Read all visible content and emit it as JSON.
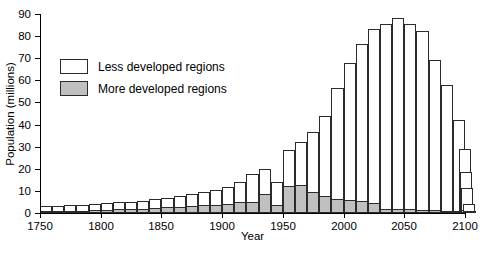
{
  "chart_data": {
    "type": "bar",
    "title": "",
    "xlabel": "Year",
    "ylabel": "Population (millions)",
    "xlim": [
      1750,
      2100
    ],
    "ylim": [
      0,
      90
    ],
    "ytick_values": [
      0,
      10,
      20,
      30,
      40,
      50,
      60,
      70,
      80,
      90
    ],
    "ytick_labels": [
      "0",
      "10",
      "20",
      "30",
      "40",
      "50",
      "60",
      "70",
      "80",
      "90"
    ],
    "xtick_values": [
      1750,
      1800,
      1850,
      1900,
      1950,
      2000,
      2050,
      2100
    ],
    "xtick_labels": [
      "1750",
      "1800",
      "1850",
      "1900",
      "1950",
      "2000",
      "2050",
      "2100"
    ],
    "grid": false,
    "stacked": true,
    "bar_interval_years": 10,
    "legend_position": "upper-left-inset",
    "series": [
      {
        "name": "Less developed regions",
        "color": "#ffffff",
        "values": [
          2.2,
          2.3,
          2.4,
          2.6,
          2.8,
          3.0,
          3.2,
          3.4,
          3.6,
          4.0,
          4.4,
          4.8,
          5.4,
          6.0,
          6.5,
          7.5,
          9.2,
          12.5,
          11.5,
          10.5,
          16.5,
          19.5,
          27.0,
          36.5,
          50.0,
          62.0,
          71.0,
          78.5,
          83.5,
          86.5,
          84.0,
          81.0,
          68.0,
          57.0,
          41.0,
          28.0,
          18.0,
          10.0,
          3.5,
          0.6
        ]
      },
      {
        "name": "More developed regions",
        "color": "#c0c0c0",
        "values": [
          0.8,
          0.9,
          1.0,
          1.1,
          1.2,
          1.4,
          1.6,
          1.8,
          2.0,
          2.2,
          2.5,
          2.8,
          3.1,
          3.4,
          3.8,
          4.3,
          4.8,
          5.2,
          8.5,
          3.5,
          12.0,
          12.5,
          9.5,
          7.5,
          6.5,
          6.0,
          5.5,
          4.5,
          2.0,
          1.8,
          1.6,
          1.4,
          1.2,
          1.0,
          0.9,
          0.8,
          0.7,
          1.5,
          0.5,
          0.3
        ]
      }
    ],
    "x": [
      1750,
      1760,
      1770,
      1780,
      1790,
      1800,
      1810,
      1820,
      1830,
      1840,
      1850,
      1860,
      1870,
      1880,
      1890,
      1900,
      1910,
      1920,
      1930,
      1940,
      1950,
      1960,
      1970,
      1980,
      1990,
      2000,
      2010,
      2020,
      2030,
      2040,
      2050,
      2060,
      2070,
      2080,
      2090,
      2095,
      2096,
      2097,
      2098,
      2099
    ],
    "totals": [
      3.0,
      3.2,
      3.4,
      3.7,
      4.0,
      4.4,
      4.8,
      5.2,
      5.6,
      6.2,
      6.9,
      7.6,
      8.5,
      9.4,
      10.3,
      11.8,
      14.0,
      17.7,
      20.0,
      14.0,
      28.5,
      32.0,
      36.5,
      44.0,
      56.5,
      68.0,
      76.5,
      83.0,
      85.5,
      88.3,
      85.6,
      82.4,
      69.2,
      58.0,
      41.9,
      28.8,
      18.7,
      11.5,
      4.0,
      0.9
    ]
  },
  "legend": {
    "items": [
      {
        "label": "Less developed regions",
        "swatch": "less"
      },
      {
        "label": "More developed regions",
        "swatch": "more"
      }
    ]
  }
}
